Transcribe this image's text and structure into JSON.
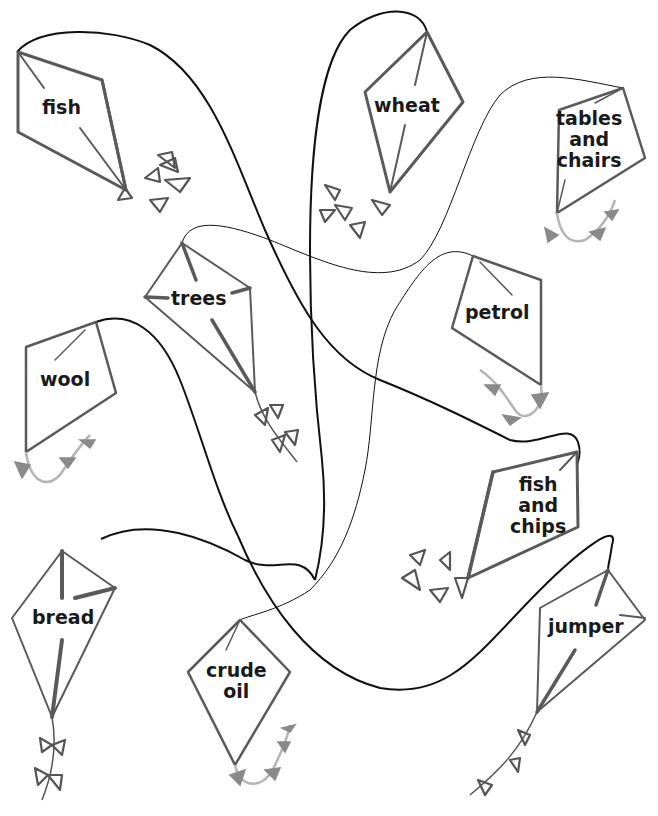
{
  "puzzle": {
    "description": "Tangled kite strings connecting pairs of kites",
    "colors": {
      "string": "#111111",
      "kite_frame": "#5a5a5a",
      "label": "#1a1a1a",
      "tail_light": "#b5b5b5"
    }
  },
  "kites": [
    {
      "id": "fish",
      "label": "fish"
    },
    {
      "id": "wheat",
      "label": "wheat"
    },
    {
      "id": "tables-and-chairs",
      "label": "tables\nand\nchairs",
      "lines": [
        "tables",
        "and",
        "chairs"
      ]
    },
    {
      "id": "trees",
      "label": "trees"
    },
    {
      "id": "petrol",
      "label": "petrol"
    },
    {
      "id": "wool",
      "label": "wool"
    },
    {
      "id": "fish-and-chips",
      "label": "fish and chips",
      "lines": [
        "fish",
        "and",
        "chips"
      ]
    },
    {
      "id": "bread",
      "label": "bread"
    },
    {
      "id": "crude-oil",
      "label": "crude oil",
      "lines": [
        "crude",
        "oil"
      ]
    },
    {
      "id": "jumper",
      "label": "jumper"
    }
  ],
  "strings": [
    {
      "from": "fish",
      "to": "fish-and-chips"
    },
    {
      "from": "wheat",
      "to": "jumper"
    },
    {
      "from": "trees",
      "to": "tables-and-chairs"
    },
    {
      "from": "wool",
      "to": "bread"
    },
    {
      "from": "petrol",
      "to": "crude-oil"
    }
  ]
}
